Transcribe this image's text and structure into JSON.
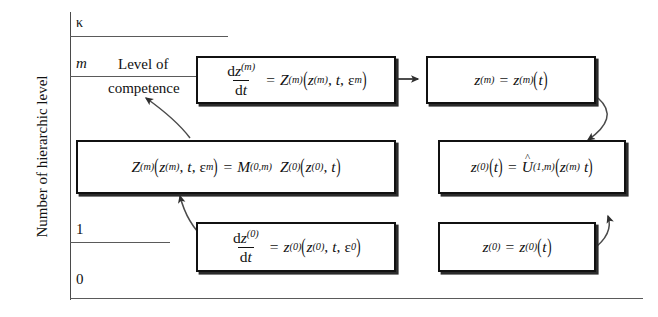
{
  "figure": {
    "y_axis_label": "Number of hierarchic level",
    "annotation_line1": "Level of",
    "annotation_line2": "competence",
    "ticks": [
      {
        "name": "kappa",
        "label": "κ"
      },
      {
        "name": "m",
        "label": "m"
      },
      {
        "name": "one",
        "label": "1"
      },
      {
        "name": "zero",
        "label": "0"
      }
    ]
  },
  "boxes": {
    "top_left": {
      "name": "equation-dz-m-dt",
      "num": "d",
      "num_var": "z",
      "num_sup": "(m)",
      "den": "d",
      "den_var": "t",
      "rhs_fn": "Z",
      "rhs_fn_sup": "(m)",
      "arg1": "z",
      "arg1_sup": "(m)",
      "arg2": "t",
      "arg3": "ε",
      "arg3_sub": "m"
    },
    "top_right": {
      "name": "equation-z-m-of-t",
      "lhs": "z",
      "lhs_sup": "(m)",
      "rhs": "z",
      "rhs_sup": "(m)",
      "arg": "t"
    },
    "middle_left": {
      "name": "equation-Z-m-equals-M-Z0",
      "lhs_fn": "Z",
      "lhs_sup": "(m)",
      "arg1": "z",
      "arg1_sup": "(m)",
      "arg2": "t",
      "arg3": "ε",
      "arg3_sub": "m",
      "rhs_M": "M",
      "rhs_M_sup": "(0,m)",
      "rhs_Z": "Z",
      "rhs_Z_sup": "(0)",
      "rhs_arg1": "z",
      "rhs_arg1_sub": "(0)",
      "rhs_arg2": "t"
    },
    "middle_right": {
      "name": "equation-z0-equals-U-hat",
      "lhs": "z",
      "lhs_sup": "(0)",
      "lhs_arg": "t",
      "rhs_U": "U",
      "rhs_U_sup": "(1,m)",
      "rhs_arg1": "z",
      "rhs_arg1_sup": "(m)",
      "rhs_arg2": "t"
    },
    "bottom_left": {
      "name": "equation-dz-0-dt",
      "num": "d",
      "num_var": "z",
      "num_sup": "(0)",
      "den": "d",
      "den_var": "t",
      "rhs_fn": "z",
      "rhs_fn_sup": "(0)",
      "arg1": "z",
      "arg1_sup": "(0)",
      "arg2": "t",
      "arg3": "ε",
      "arg3_sub": "0"
    },
    "bottom_right": {
      "name": "equation-z-0-of-t",
      "lhs": "z",
      "lhs_sup": "(0)",
      "rhs": "z",
      "rhs_sup": "(0)",
      "arg": "t"
    }
  },
  "colors": {
    "box_border": "#111111",
    "axis": "#5a5a5a",
    "background": "#ffffff",
    "arrow": "#4a4a4a"
  }
}
